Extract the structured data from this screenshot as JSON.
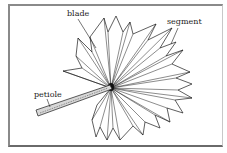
{
  "figure": {
    "labels": {
      "blade": "blade",
      "segment": "segment",
      "petiole": "petiole"
    },
    "colors": {
      "line": "#1a1a1a",
      "frame": "#8a8a8a",
      "background": "#ffffff",
      "petiole_fill": "#d8d8d8"
    }
  }
}
